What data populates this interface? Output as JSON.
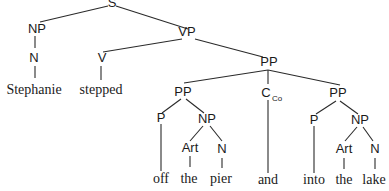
{
  "tree": {
    "title": "Syntax tree",
    "nodes": {
      "s": "S",
      "np_subj": "NP",
      "n_subj": "N",
      "vp": "VP",
      "v": "V",
      "pp_top": "PP",
      "pp1": "PP",
      "p1": "P",
      "np1": "NP",
      "art1": "Art",
      "n1": "N",
      "conj": "C",
      "conj_sub": "Co",
      "pp2": "PP",
      "p2": "P",
      "np2": "NP",
      "art2": "Art",
      "n2": "N"
    },
    "words": {
      "stephanie": "Stephanie",
      "stepped": "stepped",
      "off": "off",
      "the1": "the",
      "pier": "pier",
      "and": "and",
      "into": "into",
      "the2": "the",
      "lake": "lake"
    },
    "sentence": "Stephanie stepped off the pier and into the lake"
  }
}
